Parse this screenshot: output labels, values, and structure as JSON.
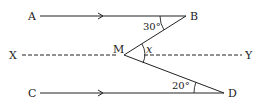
{
  "diagram": {
    "type": "geometry-parallel-lines",
    "colors": {
      "stroke": "#222222",
      "background": "#ffffff"
    },
    "points": {
      "A": {
        "label": "A",
        "x": 40,
        "y": 16
      },
      "B": {
        "label": "B",
        "x": 186,
        "y": 16
      },
      "M": {
        "label": "M",
        "x": 124,
        "y": 55
      },
      "C": {
        "label": "C",
        "x": 40,
        "y": 93
      },
      "D": {
        "label": "D",
        "x": 224,
        "y": 93
      },
      "X": {
        "label": "X",
        "x": 22,
        "y": 55
      },
      "Y": {
        "label": "Y",
        "x": 242,
        "y": 55
      }
    },
    "segments": [
      {
        "from": "A",
        "to": "B",
        "style": "solid",
        "arrow": true
      },
      {
        "from": "C",
        "to": "D",
        "style": "solid",
        "arrow": true
      },
      {
        "from": "X",
        "to": "Y",
        "style": "dashed"
      },
      {
        "from": "B",
        "to": "M",
        "style": "solid"
      },
      {
        "from": "M",
        "to": "D",
        "style": "solid"
      }
    ],
    "angles": {
      "abm": {
        "label": "30°",
        "vertex": "B"
      },
      "mdc": {
        "label": "20°",
        "vertex": "D"
      },
      "bmd_x": {
        "label": "x",
        "vertex": "M"
      }
    }
  }
}
